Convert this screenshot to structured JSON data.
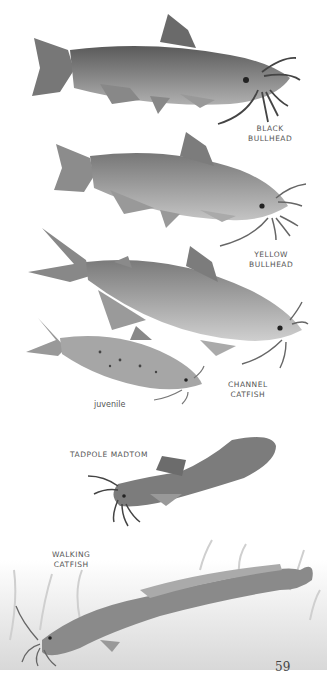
{
  "page": {
    "number": "59",
    "background": "#ffffff"
  },
  "fish": [
    {
      "id": "black-bullhead",
      "label_line1": "BLACK",
      "label_line2": "BULLHEAD",
      "color": "#6e6e6e"
    },
    {
      "id": "yellow-bullhead",
      "label_line1": "YELLOW",
      "label_line2": "BULLHEAD",
      "color": "#8a8a8a"
    },
    {
      "id": "channel-catfish",
      "label_line1": "CHANNEL",
      "label_line2": "CATFISH",
      "sublabel": "juvenile",
      "color": "#909090"
    },
    {
      "id": "tadpole-madtom",
      "label_line1": "TADPOLE MADTOM",
      "color": "#7a7a7a"
    },
    {
      "id": "walking-catfish",
      "label_line1": "WALKING",
      "label_line2": "CATFISH",
      "color": "#808080"
    }
  ]
}
